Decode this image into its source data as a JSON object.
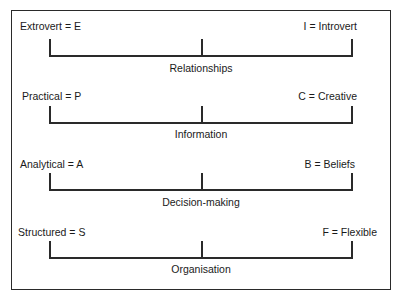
{
  "diagram": {
    "colors": {
      "line": "#2a2a2a",
      "text": "#1a1a1a",
      "background": "#ffffff"
    },
    "scales": [
      {
        "left_label": "Extrovert = E",
        "right_label": "I = Introvert",
        "dimension": "Relationships"
      },
      {
        "left_label": "Practical = P",
        "right_label": "C = Creative",
        "dimension": "Information"
      },
      {
        "left_label": "Analytical = A",
        "right_label": "B = Beliefs",
        "dimension": "Decision-making"
      },
      {
        "left_label": "Structured = S",
        "right_label": "F = Flexible",
        "dimension": "Organisation"
      }
    ]
  }
}
